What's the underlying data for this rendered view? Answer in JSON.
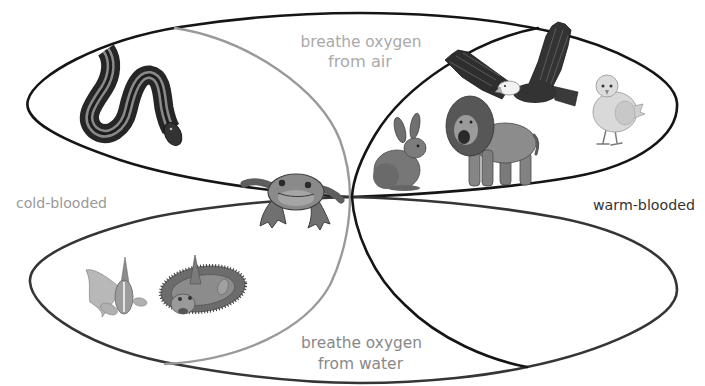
{
  "labels": {
    "air": [
      "breathe oxygen",
      "from air"
    ],
    "water": [
      "breathe oxygen",
      "from water"
    ],
    "cold": "cold-blooded",
    "warm": "warm-blooded"
  },
  "sets": [
    {
      "id": "air",
      "label": "breathe oxygen from air",
      "position": "top",
      "outline_color": "#151515",
      "label_color": "#aaaaaa"
    },
    {
      "id": "water",
      "label": "breathe oxygen from water",
      "position": "bottom",
      "outline_color": "#333333",
      "label_color": "#888888"
    },
    {
      "id": "cold",
      "label": "cold-blooded",
      "position": "left",
      "outline_color": "#9a9a9a",
      "label_color": "#999999"
    },
    {
      "id": "warm",
      "label": "warm-blooded",
      "position": "right",
      "outline_color": "#151515",
      "label_color": "#333333"
    }
  ],
  "illustrations": [
    {
      "name": "snake",
      "icon": "snake-icon",
      "sets": [
        "cold-blooded",
        "breathe oxygen from air"
      ]
    },
    {
      "name": "frog",
      "icon": "frog-icon",
      "sets": [
        "cold-blooded",
        "breathe oxygen from air",
        "breathe oxygen from water"
      ]
    },
    {
      "name": "rabbit",
      "icon": "rabbit-icon",
      "sets": [
        "warm-blooded",
        "breathe oxygen from air"
      ]
    },
    {
      "name": "lion",
      "icon": "lion-icon",
      "sets": [
        "warm-blooded",
        "breathe oxygen from air"
      ]
    },
    {
      "name": "eagle",
      "icon": "eagle-icon",
      "sets": [
        "warm-blooded",
        "breathe oxygen from air"
      ]
    },
    {
      "name": "chick",
      "icon": "chick-icon",
      "sets": [
        "warm-blooded",
        "breathe oxygen from air"
      ]
    },
    {
      "name": "goldfish",
      "icon": "goldfish-icon",
      "sets": [
        "cold-blooded",
        "breathe oxygen from water"
      ]
    },
    {
      "name": "flounder",
      "icon": "flounder-icon",
      "sets": [
        "cold-blooded",
        "breathe oxygen from water"
      ]
    }
  ],
  "colors": {
    "background": "#ffffff",
    "air_label": "#aaaaaa",
    "water_label": "#888888",
    "cold_label": "#999999",
    "warm_label": "#333333"
  }
}
